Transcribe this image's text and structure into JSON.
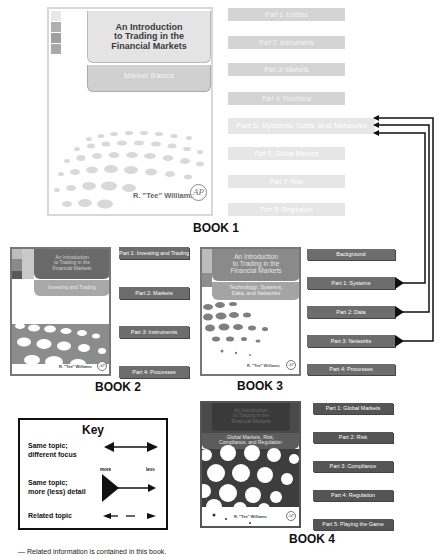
{
  "book1": {
    "label": "BOOK 1",
    "cover": {
      "title_lines": [
        "An Introduction",
        "to Trading in the",
        "Financial Markets"
      ],
      "subtitle": "Market Basics",
      "author": "R. \"Tee\" Williams",
      "publisher_logo": "AP"
    },
    "parts": [
      {
        "label": "Part 1: Entities"
      },
      {
        "label": "Part 2: Instruments"
      },
      {
        "label": "Part 3: Markets"
      },
      {
        "label": "Part 4: Functions"
      },
      {
        "label": "Part 5: Systems, Data, and Networks"
      },
      {
        "label": "Part 6: Global Markets"
      },
      {
        "label": "Part 7: Risk"
      },
      {
        "label": "Part 8: Regulation"
      }
    ]
  },
  "book2": {
    "label": "BOOK 2",
    "cover": {
      "title_lines": [
        "An Introduction",
        "to Trading in the",
        "Financial Markets"
      ],
      "subtitle": "Investing and Trading",
      "author": "R. \"Tee\" Williams",
      "publisher_logo": "AP"
    },
    "parts": [
      {
        "label": "Part 1: Investing and Trading"
      },
      {
        "label": "Part 2: Markets"
      },
      {
        "label": "Part 3: Instruments"
      },
      {
        "label": "Part 4: Processes"
      }
    ]
  },
  "book3": {
    "label": "BOOK 3",
    "cover": {
      "title_lines": [
        "An Introduction",
        "to Trading in the",
        "Financial Markets"
      ],
      "subtitle_lines": [
        "Technology: Systems,",
        "Data, and Networks"
      ],
      "author": "R. \"Tee\" Williams",
      "publisher_logo": "AP"
    },
    "parts": [
      {
        "label": "Background"
      },
      {
        "label": "Part 1: Systems"
      },
      {
        "label": "Part 2: Data"
      },
      {
        "label": "Part 3: Networks"
      },
      {
        "label": "Part 4: Processes"
      }
    ]
  },
  "book4": {
    "label": "BOOK 4",
    "cover": {
      "title_lines": [
        "An Introduction",
        "to Trading in the",
        "Financial Markets"
      ],
      "subtitle_lines": [
        "Global Markets, Risk,",
        "Compliance, and Regulation"
      ],
      "author": "R. \"Tee\" Williams",
      "publisher_logo": "AP"
    },
    "parts": [
      {
        "label": "Part 1: Global Markets"
      },
      {
        "label": "Part 2: Risk"
      },
      {
        "label": "Part 3: Compliance"
      },
      {
        "label": "Part 4: Regulation"
      },
      {
        "label": "Part 5: Playing the Game"
      }
    ]
  },
  "key": {
    "title": "Key",
    "rows": [
      {
        "label_lines": [
          "Same topic;",
          "different focus"
        ],
        "symbol": "double-headed-arrow"
      },
      {
        "label_lines": [
          "Same topic;",
          "more (less) detail"
        ],
        "symbol": "triangle-to-arrow",
        "left_note": "more",
        "right_note": "less"
      },
      {
        "label_lines": [
          "Related topic"
        ],
        "symbol": "dashed-arrow"
      }
    ]
  },
  "caption": "—  Related information is contained in this book.",
  "colors": {
    "bar_dark": "#6d6d6d",
    "bar_faded": "#d4d4d4",
    "connector": "#111111",
    "cover_panel_dark": "#5a5a5a",
    "cover_panel_light": "#c8c8c8"
  }
}
